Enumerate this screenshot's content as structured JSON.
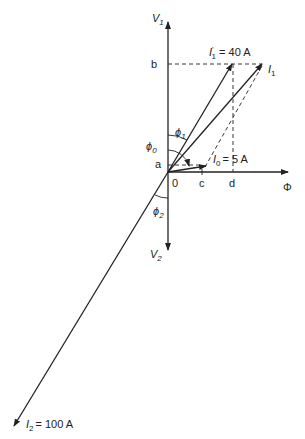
{
  "diagram": {
    "axes": {
      "v1": {
        "main": "V",
        "sub": "1"
      },
      "v2": {
        "main": "V",
        "sub": "2"
      },
      "phi": "Φ"
    },
    "points": {
      "a": "a",
      "b": "b",
      "c": "c",
      "d": "d",
      "origin": "0"
    },
    "phasors": {
      "i1prime": {
        "main": "I",
        "sup": "'",
        "sub": "1",
        "value": "= 40 A"
      },
      "i1": {
        "main": "I",
        "sub": "1"
      },
      "i0": {
        "main": "I",
        "sub": "0",
        "value": "= 5 A"
      },
      "i2": {
        "main": "I",
        "sub": "2",
        "value": "= 100 A"
      }
    },
    "angles": {
      "phi0": {
        "main": "ϕ",
        "sub": "0"
      },
      "phi1": {
        "main": "ϕ",
        "sub": "1"
      },
      "phi2": {
        "main": "ϕ",
        "sub": "2"
      }
    }
  }
}
